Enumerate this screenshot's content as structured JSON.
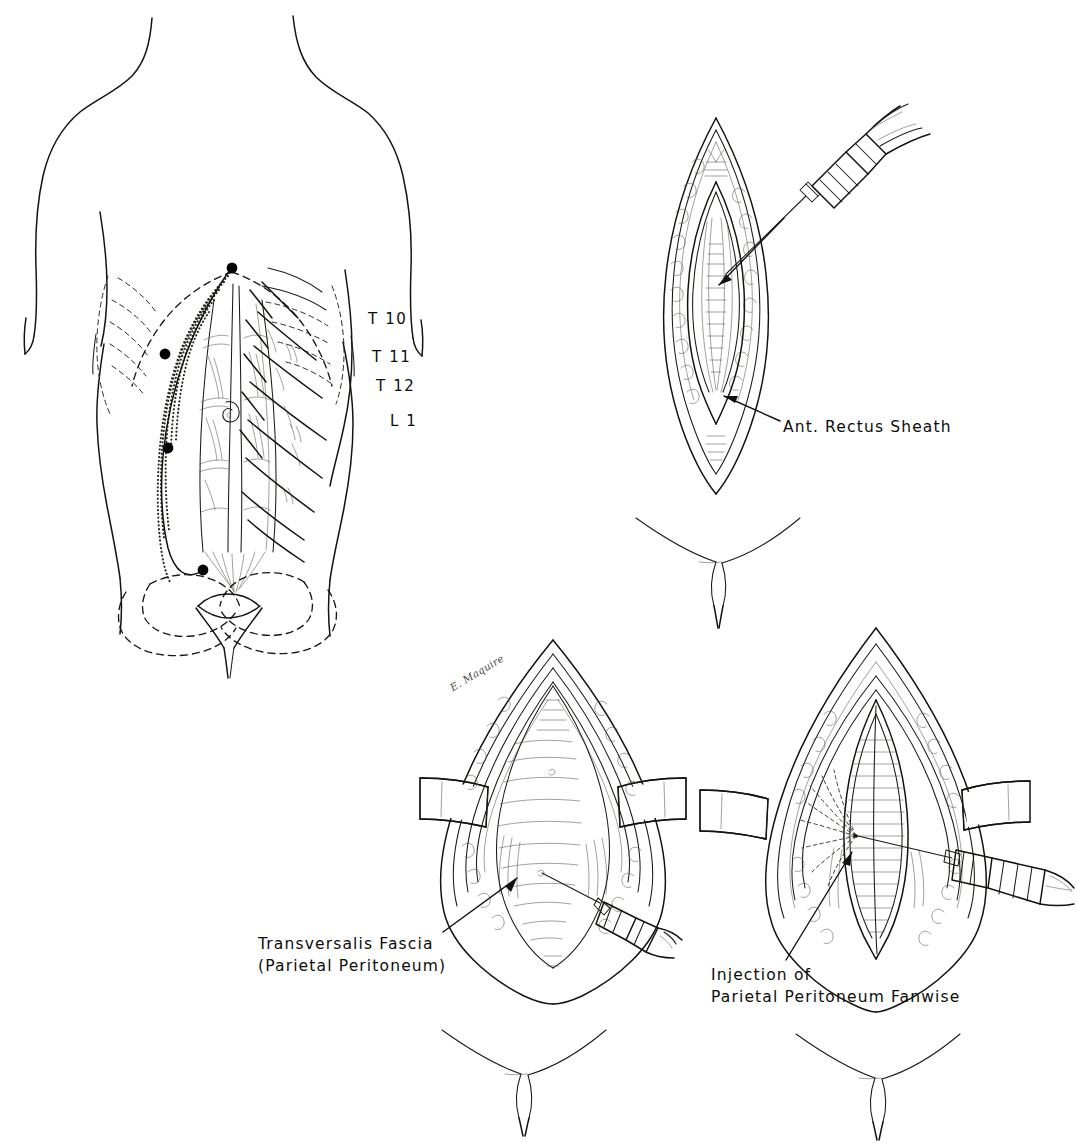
{
  "figure": {
    "background_color": "#ffffff",
    "ink_color": "#14130f"
  },
  "panels": [
    {
      "id": "panel-torso",
      "name": "anterior-abdominal-wall-surface-anatomy",
      "description": "Anterior torso showing midline incision, skin wheal injection sites and segmental nerve levels",
      "nerve_labels": [
        {
          "text": "T 10",
          "x": 368,
          "y": 318
        },
        {
          "text": "T 11",
          "x": 372,
          "y": 356
        },
        {
          "text": "T 12",
          "x": 376,
          "y": 385
        },
        {
          "text": "L 1",
          "x": 390,
          "y": 420
        }
      ],
      "injection_sites": [
        {
          "label": "xiphoid-wheal",
          "x": 232,
          "y": 268
        },
        {
          "label": "upper-midline-wheal",
          "x": 165,
          "y": 354
        },
        {
          "label": "umbilical-level-wheal",
          "x": 168,
          "y": 448
        },
        {
          "label": "suprapubic-wheal",
          "x": 203,
          "y": 570
        }
      ],
      "injection_site_count": 4
    },
    {
      "id": "panel-rectus-sheath",
      "name": "anterior-rectus-sheath-injection",
      "description": "Skin incision opened, syringe infiltrating the anterior rectus sheath",
      "label": {
        "line1": "Ant. Rectus Sheath",
        "x": 783,
        "y": 416
      }
    },
    {
      "id": "panel-transversalis",
      "name": "transversalis-fascia-injection",
      "description": "Retractors hold the wound open, syringe directed at the transversalis fascia",
      "label": {
        "line1": "Transversalis Fascia",
        "line2": "(Parietal Peritoneum)",
        "x": 258,
        "y": 934
      }
    },
    {
      "id": "panel-fanwise",
      "name": "parietal-peritoneum-fanwise-injection",
      "description": "Needle advanced beneath the peritoneum, anesthetic spread in a fan pattern",
      "label": {
        "line1": "Injection of",
        "line2": "Parietal Peritoneum Fanwise",
        "x": 711,
        "y": 965
      }
    }
  ],
  "artist_signature": {
    "text": "E. Maquire",
    "x": 451,
    "y": 683
  },
  "groin_sketches": [
    {
      "name": "groin-landmark-upper",
      "x": 718,
      "y": 520
    },
    {
      "name": "groin-landmark-lower-left",
      "x": 523,
      "y": 1032
    },
    {
      "name": "groin-landmark-lower-right",
      "x": 877,
      "y": 1036
    }
  ]
}
